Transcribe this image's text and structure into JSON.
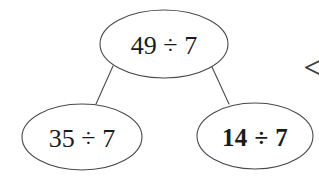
{
  "diagram": {
    "type": "factor-tree",
    "background_color": "#ffffff",
    "stroke_color": "#4a4a4a",
    "text_color": "#1b1b1b",
    "nodes": [
      {
        "id": "root",
        "label": "49 ÷ 7",
        "role": "parent-node",
        "weight": "regular",
        "cx": 164,
        "cy": 44,
        "rx": 64,
        "ry": 34
      },
      {
        "id": "left-child",
        "label": "35 ÷ 7",
        "role": "child-node-left",
        "weight": "regular",
        "cx": 82,
        "cy": 137,
        "rx": 60,
        "ry": 33
      },
      {
        "id": "right-child",
        "label": "14 ÷ 7",
        "role": "child-node-right",
        "weight": "bold",
        "cx": 255,
        "cy": 136,
        "rx": 58,
        "ry": 33
      }
    ],
    "connectors": [
      {
        "id": "root-to-left",
        "from": "root",
        "to": "left-child",
        "x1": 113,
        "y1": 66,
        "x2": 96,
        "y2": 104
      },
      {
        "id": "root-to-right",
        "from": "root",
        "to": "right-child",
        "x1": 212,
        "y1": 67,
        "x2": 229,
        "y2": 104
      }
    ],
    "annotations": [
      {
        "id": "comparator",
        "symbol": "<",
        "role": "less-than-symbol",
        "clipped": true,
        "x": 303,
        "y": 67
      }
    ]
  }
}
